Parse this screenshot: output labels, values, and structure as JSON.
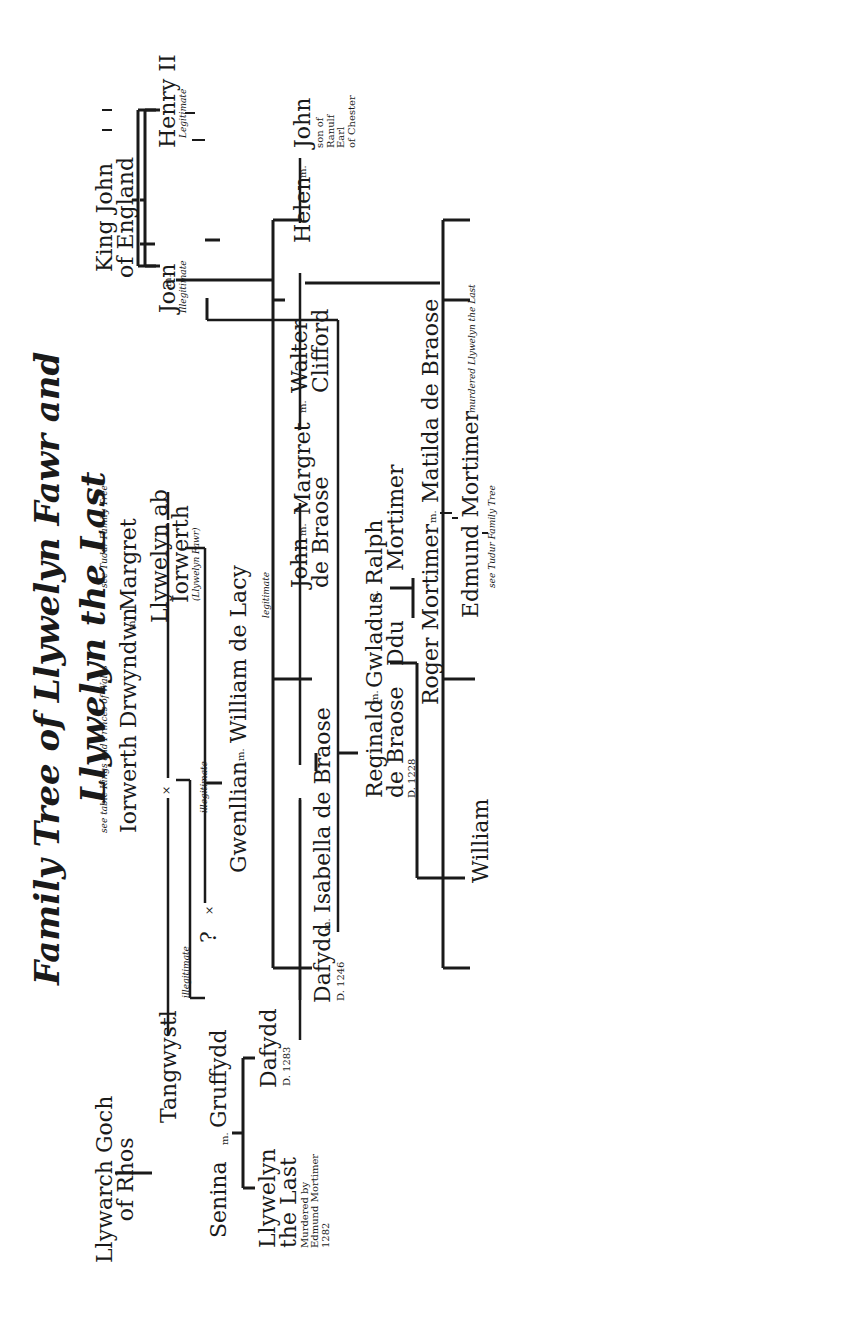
{
  "title": {
    "line1": "Family Tree of Llywelyn Fawr and",
    "line2": "Llywelyn the Last"
  },
  "notes": {
    "see_kings": "see table Kings and Princes of Wales",
    "see_tudur_top": "see Tudur Family Tree",
    "see_tudur_bottom": "see Tudur Family Tree",
    "murdered_note": "murdered Llywelyn the Last",
    "legitimate_branch": "legitimate",
    "illegitimate_1": "illegitimate",
    "illegitimate_2": "illegitimate"
  },
  "marks": {
    "married": "m.",
    "union": "×",
    "unknown": "?"
  },
  "people": {
    "king_john": {
      "l1": "King John",
      "l2": "of England"
    },
    "joan": {
      "name": "Joan",
      "note": "Illegitimate"
    },
    "henry_ii": {
      "name": "Henry II",
      "note": "Legitimate"
    },
    "iorwerth": {
      "name": "Iorwerth Drwyndwn"
    },
    "margret_mother": {
      "name": "Margret"
    },
    "llywelyn_fawr": {
      "l1": "Llywelyn ab",
      "l2": "Iorwerth",
      "note": "(Llywelyn Fawr)"
    },
    "llywarch": {
      "l1": "Llywarch Goch",
      "l2": "of Rhos"
    },
    "tangwystl": {
      "name": "Tangwystl"
    },
    "gruffydd": {
      "name": "Gruffydd"
    },
    "senina": {
      "name": "Senina"
    },
    "llywelyn_last": {
      "l1": "Llywelyn",
      "l2": "the Last",
      "n1": "Murdered by",
      "n2": "Edmund Mortimer",
      "n3": "1282"
    },
    "dafydd_1283": {
      "name": "Dafydd",
      "date": "D. 1283"
    },
    "unknown_partner": {
      "name": "?"
    },
    "gwenllian": {
      "name": "Gwenllian"
    },
    "william_de_lacy": {
      "name": "William de Lacy"
    },
    "dafydd_1246": {
      "name": "Dafydd",
      "date": "D. 1246"
    },
    "isabella": {
      "name": "Isabella de Braose"
    },
    "reginald": {
      "l1": "Reginald",
      "l2": "de Braose",
      "date": "D. 1228"
    },
    "gwladus": {
      "l1": "Gwladus",
      "l2": "Ddu"
    },
    "william": {
      "name": "William"
    },
    "ralph": {
      "l1": "Ralph",
      "l2": "Mortimer"
    },
    "roger": {
      "name": "Roger Mortimer"
    },
    "matilda": {
      "name": "Matilda de Braose"
    },
    "edmund": {
      "name": "Edmund Mortimer"
    },
    "john_braose": {
      "l1": "John",
      "l2": "de Braose"
    },
    "margret_daughter": {
      "name": "Margret"
    },
    "walter": {
      "l1": "Walter",
      "l2": "Clifford"
    },
    "helen": {
      "name": "Helen"
    },
    "john_chester": {
      "name": "John",
      "n1": "son of",
      "n2": "Ranulf",
      "n3": "Earl",
      "n4": "of Chester"
    }
  }
}
